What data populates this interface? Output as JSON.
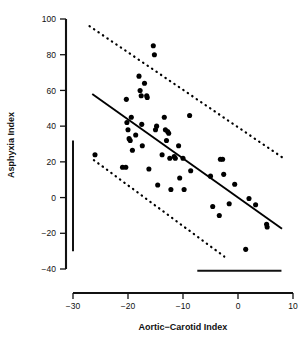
{
  "chart_data": {
    "type": "scatter",
    "title": "",
    "xlabel": "Aortic−Carotid Index",
    "ylabel": "Asphyxia Index",
    "xlim": [
      -30,
      10
    ],
    "ylim": [
      -40,
      100
    ],
    "xticks": [
      -30,
      -20,
      -10,
      0,
      10
    ],
    "xtick_labels": [
      "−30",
      "−20",
      "−10",
      "0",
      "10"
    ],
    "yticks": [
      -40,
      -20,
      0,
      20,
      40,
      60,
      80,
      100
    ],
    "ytick_labels": [
      "−40",
      "−20",
      "0",
      "20",
      "40",
      "60",
      "80",
      "100"
    ],
    "grid": false,
    "legend": "none",
    "marker": {
      "shape": "circle",
      "color": "#000000",
      "size": 4.6
    },
    "points": [
      {
        "x": -26.0,
        "y": 24.0
      },
      {
        "x": -21.0,
        "y": 17.0
      },
      {
        "x": -20.4,
        "y": 17.0
      },
      {
        "x": -20.3,
        "y": 55.0
      },
      {
        "x": -20.2,
        "y": 42.0
      },
      {
        "x": -20.0,
        "y": 38.0
      },
      {
        "x": -19.8,
        "y": 33.0
      },
      {
        "x": -19.6,
        "y": 32.0
      },
      {
        "x": -19.4,
        "y": 45.0
      },
      {
        "x": -19.2,
        "y": 26.5
      },
      {
        "x": -18.6,
        "y": 35.0
      },
      {
        "x": -18.0,
        "y": 68.0
      },
      {
        "x": -17.8,
        "y": 60.0
      },
      {
        "x": -17.6,
        "y": 57.0
      },
      {
        "x": -17.5,
        "y": 41.0
      },
      {
        "x": -17.4,
        "y": 29.0
      },
      {
        "x": -17.0,
        "y": 64.0
      },
      {
        "x": -16.6,
        "y": 57.0
      },
      {
        "x": -16.5,
        "y": 56.0
      },
      {
        "x": -16.2,
        "y": 16.0
      },
      {
        "x": -15.4,
        "y": 85.0
      },
      {
        "x": -15.2,
        "y": 80.0
      },
      {
        "x": -15.0,
        "y": 38.0
      },
      {
        "x": -14.8,
        "y": 40.0
      },
      {
        "x": -14.6,
        "y": 7.0
      },
      {
        "x": -13.8,
        "y": 24.0
      },
      {
        "x": -13.4,
        "y": 45.0
      },
      {
        "x": -13.2,
        "y": 38.0
      },
      {
        "x": -13.0,
        "y": 32.0
      },
      {
        "x": -12.8,
        "y": 37.0
      },
      {
        "x": -12.6,
        "y": 36.0
      },
      {
        "x": -12.4,
        "y": 22.0
      },
      {
        "x": -12.2,
        "y": 4.5
      },
      {
        "x": -11.6,
        "y": 23.0
      },
      {
        "x": -11.4,
        "y": 22.0
      },
      {
        "x": -10.8,
        "y": 29.0
      },
      {
        "x": -10.6,
        "y": 11.0
      },
      {
        "x": -10.0,
        "y": 22.0
      },
      {
        "x": -9.8,
        "y": 4.5
      },
      {
        "x": -8.8,
        "y": 46.0
      },
      {
        "x": -8.6,
        "y": 15.0
      },
      {
        "x": -5.0,
        "y": 12.0
      },
      {
        "x": -4.6,
        "y": -5.0
      },
      {
        "x": -3.4,
        "y": -10.0
      },
      {
        "x": -3.2,
        "y": 21.5
      },
      {
        "x": -2.8,
        "y": 21.5
      },
      {
        "x": -2.6,
        "y": 13.0
      },
      {
        "x": -1.6,
        "y": -3.5
      },
      {
        "x": -0.6,
        "y": 7.5
      },
      {
        "x": 1.4,
        "y": -29.0
      },
      {
        "x": 2.0,
        "y": -0.5
      },
      {
        "x": 3.2,
        "y": -4.0
      },
      {
        "x": 5.2,
        "y": -15.0
      },
      {
        "x": 5.3,
        "y": -16.5
      }
    ],
    "regression_line": {
      "style": "solid",
      "x1": -26.5,
      "y1": 58.0,
      "x2": 8.0,
      "y2": -17.5
    },
    "bands": [
      {
        "name": "upper-confidence-band",
        "style": "dotted",
        "x1": -27.0,
        "y1": 96.0,
        "x2": 8.3,
        "y2": 22.0
      },
      {
        "name": "lower-confidence-band",
        "style": "dotted",
        "x1": -26.2,
        "y1": 21.0,
        "x2": -2.5,
        "y2": -33.0
      }
    ],
    "reference_bars": [
      {
        "name": "vertical-reference-bar",
        "orientation": "vertical",
        "x": -30.0,
        "y1": 32.0,
        "y2": -30.0
      },
      {
        "name": "horizontal-reference-bar",
        "orientation": "horizontal",
        "y": -41.0,
        "x1": -7.4,
        "x2": 7.9
      }
    ]
  }
}
